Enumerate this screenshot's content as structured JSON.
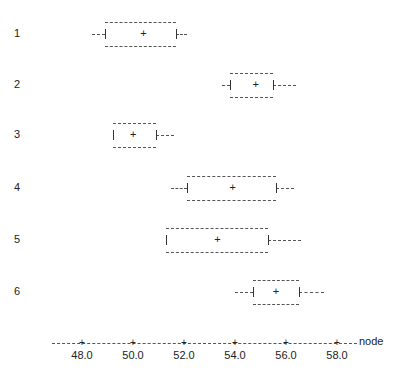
{
  "chart_data": {
    "type": "boxplot",
    "title": "",
    "xlabel": "node",
    "ylabel": "",
    "xlim": [
      46.5,
      59.5
    ],
    "x_ticks": [
      "48.0",
      "50.0",
      "52.0",
      "54.0",
      "56.0",
      "58.0"
    ],
    "grid": false,
    "categories": [
      "1",
      "2",
      "3",
      "4",
      "5",
      "6"
    ],
    "series": [
      {
        "name": "1",
        "whisker_low": 48.4,
        "q1": 48.9,
        "mean": 50.4,
        "q3": 51.7,
        "whisker_high": 52.1
      },
      {
        "name": "2",
        "whisker_low": 53.5,
        "q1": 53.8,
        "mean": 54.8,
        "q3": 55.5,
        "whisker_high": 56.4
      },
      {
        "name": "3",
        "whisker_low": 49.2,
        "q1": 49.2,
        "mean": 50.0,
        "q3": 50.9,
        "whisker_high": 51.6
      },
      {
        "name": "4",
        "whisker_low": 51.5,
        "q1": 52.1,
        "mean": 53.9,
        "q3": 55.6,
        "whisker_high": 56.3
      },
      {
        "name": "5",
        "whisker_low": 51.3,
        "q1": 51.3,
        "mean": 53.3,
        "q3": 55.3,
        "whisker_high": 56.6
      },
      {
        "name": "6",
        "whisker_low": 54.0,
        "q1": 54.7,
        "mean": 55.6,
        "q3": 56.5,
        "whisker_high": 57.5
      }
    ]
  },
  "axis": {
    "name": "node",
    "ticks": [
      "48.0",
      "50.0",
      "52.0",
      "54.0",
      "56.0",
      "58.0"
    ]
  },
  "rows": [
    "1",
    "2",
    "3",
    "4",
    "5",
    "6"
  ]
}
